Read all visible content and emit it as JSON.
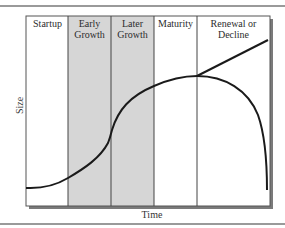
{
  "diagram": {
    "stages": [
      {
        "label_line1": "Startup",
        "label_line2": "",
        "shaded": false
      },
      {
        "label_line1": "Early",
        "label_line2": "Growth",
        "shaded": true
      },
      {
        "label_line1": "Later",
        "label_line2": "Growth",
        "shaded": true
      },
      {
        "label_line1": "Maturity",
        "label_line2": "",
        "shaded": false
      },
      {
        "label_line1": "Renewal or",
        "label_line2": "Decline",
        "shaded": false
      }
    ],
    "y_axis_label": "Size",
    "x_axis_label": "Time",
    "branches": [
      "Renewal (rising line)",
      "Decline (falling curve)"
    ],
    "colors": {
      "shaded": "#d6d6d6",
      "line": "#1a1a1a",
      "border": "#555555",
      "shadow": "#7a7a7a",
      "rule": "#9a9a9a"
    }
  }
}
